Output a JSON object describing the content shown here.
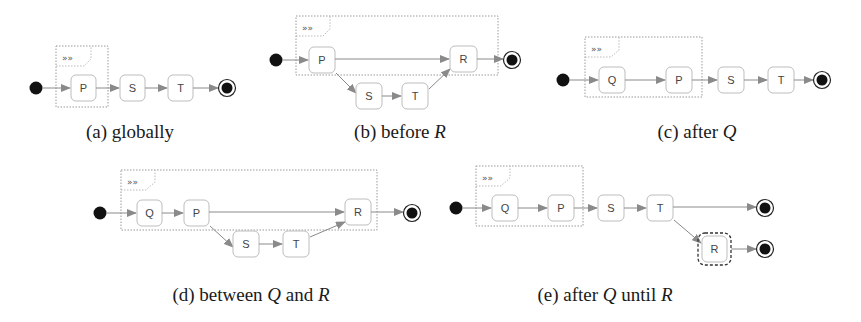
{
  "colors": {
    "node_stroke": "#bdbdbd",
    "edge": "#8a8a8a",
    "fragment_border": "#9a9a9a",
    "initial_fill": "#111111",
    "caption": "#1a1a1a"
  },
  "fragment_icon": "»»",
  "panels": [
    {
      "id": "a",
      "caption_prefix": "(a) globally",
      "caption_math": "",
      "caption_suffix": "",
      "states": [
        "P",
        "S",
        "T"
      ]
    },
    {
      "id": "b",
      "caption_prefix": "(b) before ",
      "caption_math": "R",
      "caption_suffix": "",
      "states": [
        "P",
        "S",
        "T",
        "R"
      ]
    },
    {
      "id": "c",
      "caption_prefix": "(c) after ",
      "caption_math": "Q",
      "caption_suffix": "",
      "states": [
        "Q",
        "P",
        "S",
        "T"
      ]
    },
    {
      "id": "d",
      "caption_prefix": "(d) between ",
      "caption_math": "Q",
      "caption_suffix": " and ",
      "caption_math2": "R",
      "states": [
        "Q",
        "P",
        "S",
        "T",
        "R"
      ]
    },
    {
      "id": "e",
      "caption_prefix": "(e) after ",
      "caption_math": "Q",
      "caption_suffix": " until ",
      "caption_math2": "R",
      "states": [
        "Q",
        "P",
        "S",
        "T",
        "R"
      ]
    }
  ]
}
